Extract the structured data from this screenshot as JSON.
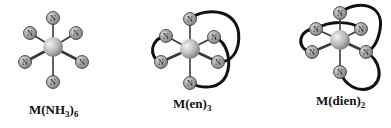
{
  "figure": {
    "complexes": [
      {
        "name": "M(NH3)6",
        "label_main": "M(NH",
        "label_sub1": "3",
        "label_mid": ")",
        "label_sub2": "6",
        "ligand_type": "monodentate"
      },
      {
        "name": "M(en)3",
        "label_main": "M(en)",
        "label_sub1": "3",
        "ligand_type": "bidentate"
      },
      {
        "name": "M(dien)2",
        "label_main": "M(dien)",
        "label_sub1": "2",
        "ligand_type": "tridentate"
      }
    ],
    "atom_label": "N",
    "colors": {
      "metal": "#b8b8b8",
      "ligand_atom": "#9a9a9a",
      "bond": "#333333",
      "chelate": "#111111"
    }
  }
}
